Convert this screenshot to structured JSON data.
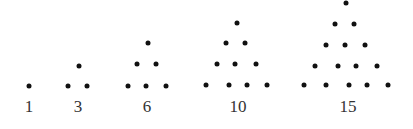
{
  "colors": {
    "dot": "#111111",
    "label": "#333333",
    "background": "#ffffff"
  },
  "figures": [
    {
      "label": "1",
      "label_pos": [
        29,
        106
      ],
      "dots": [
        [
          29,
          86
        ]
      ]
    },
    {
      "label": "3",
      "label_pos": [
        78,
        106
      ],
      "dots": [
        [
          79,
          66
        ],
        [
          68,
          86
        ],
        [
          87,
          86
        ]
      ]
    },
    {
      "label": "6",
      "label_pos": [
        147,
        106
      ],
      "dots": [
        [
          148,
          43
        ],
        [
          137,
          64
        ],
        [
          156,
          64
        ],
        [
          128,
          86
        ],
        [
          146,
          86
        ],
        [
          166,
          86
        ]
      ]
    },
    {
      "label": "10",
      "label_pos": [
        238,
        106
      ],
      "dots": [
        [
          237,
          23
        ],
        [
          226,
          43
        ],
        [
          245,
          43
        ],
        [
          217,
          64
        ],
        [
          235,
          64
        ],
        [
          256,
          64
        ],
        [
          206,
          85
        ],
        [
          229,
          85
        ],
        [
          247,
          85
        ],
        [
          267,
          85
        ]
      ]
    },
    {
      "label": "15",
      "label_pos": [
        348,
        106
      ],
      "dots": [
        [
          346,
          3
        ],
        [
          335,
          24
        ],
        [
          354,
          24
        ],
        [
          326,
          45
        ],
        [
          345,
          45
        ],
        [
          365,
          45
        ],
        [
          315,
          66
        ],
        [
          338,
          66
        ],
        [
          356,
          66
        ],
        [
          377,
          66
        ],
        [
          304,
          85
        ],
        [
          326,
          85
        ],
        [
          349,
          85
        ],
        [
          367,
          85
        ],
        [
          388,
          85
        ]
      ]
    }
  ]
}
